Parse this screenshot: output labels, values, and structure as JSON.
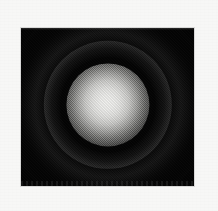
{
  "figure": {
    "kind": "airy-diffraction-pattern",
    "caption": "",
    "alt_text": "Concentric diffraction rings with bright central disc on black background",
    "panel": {
      "x": 21,
      "y": 28,
      "width": 173,
      "height": 158,
      "background_color": "#050505"
    },
    "page_background_color": "#f7f7f6",
    "render_style": "halftone-dithered grayscale scan"
  },
  "chart_data": {
    "type": "heatmap",
    "title": "",
    "subtitle": "",
    "xlabel": "",
    "ylabel": "",
    "colormap": "grayscale",
    "grid": false,
    "legend": "none",
    "center": {
      "x": 108,
      "y": 105
    },
    "xlim": [
      21,
      194
    ],
    "ylim": [
      28,
      186
    ],
    "radial_profile": {
      "description": "Normalised intensity vs radius in pixels, Airy diffraction pattern",
      "radius_px": [
        0,
        6,
        12,
        18,
        24,
        30,
        36,
        42,
        48,
        54,
        60,
        66,
        72,
        78,
        84,
        90
      ],
      "intensity": [
        1.0,
        0.97,
        0.88,
        0.7,
        0.44,
        0.2,
        0.05,
        0.01,
        0.06,
        0.1,
        0.06,
        0.01,
        0.02,
        0.03,
        0.01,
        0.0
      ]
    },
    "features": [
      {
        "name": "central-airy-disc",
        "inner_radius_px": 0,
        "outer_radius_px": 32,
        "peak_intensity": 1.0,
        "peak_gray": "#f2f2f0"
      },
      {
        "name": "first-minimum",
        "inner_radius_px": 32,
        "outer_radius_px": 42,
        "peak_intensity": 0.01,
        "peak_gray": "#050505"
      },
      {
        "name": "first-bright-ring",
        "inner_radius_px": 42,
        "outer_radius_px": 60,
        "peak_intensity": 0.1,
        "peak_gray": "#2a2a2a"
      },
      {
        "name": "second-minimum",
        "inner_radius_px": 60,
        "outer_radius_px": 68,
        "peak_intensity": 0.01,
        "peak_gray": "#070707"
      },
      {
        "name": "second-bright-ring",
        "inner_radius_px": 68,
        "outer_radius_px": 84,
        "peak_intensity": 0.03,
        "peak_gray": "#1a1a1a"
      }
    ]
  }
}
